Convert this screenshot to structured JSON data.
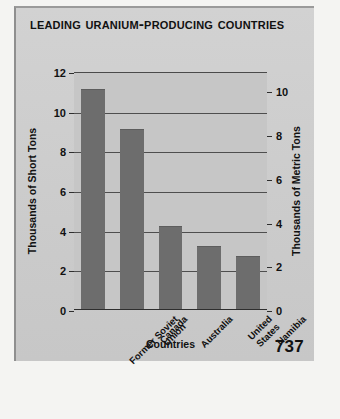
{
  "page": {
    "number": "737"
  },
  "chart_data": {
    "type": "bar",
    "title": "Leading Uranium-Producing Countries",
    "xlabel": "Countries",
    "ylabel": "Thousands of Short Tons",
    "ylabel_secondary": "Thousands of Metric Tons",
    "categories": [
      "Former Soviet\nUnion",
      "Canada",
      "Australia",
      "United States",
      "Namibia"
    ],
    "values": [
      11.1,
      9.1,
      4.2,
      3.2,
      2.65
    ],
    "ylim": [
      0,
      12
    ],
    "yticks": [
      0,
      2,
      4,
      6,
      8,
      10,
      12
    ],
    "yticklabels": [
      "0",
      "2",
      "4",
      "6",
      "8",
      "10",
      "12"
    ],
    "ylim_secondary": [
      0,
      10.89
    ],
    "yticks_secondary": [
      0,
      2,
      4,
      6,
      8,
      10
    ],
    "yticklabels_secondary": [
      "0",
      "2",
      "4",
      "6",
      "8",
      "10"
    ],
    "grid": true,
    "legend": "none",
    "bar_color": "#6d6d6d",
    "plot_background": "#c6c6c6"
  }
}
